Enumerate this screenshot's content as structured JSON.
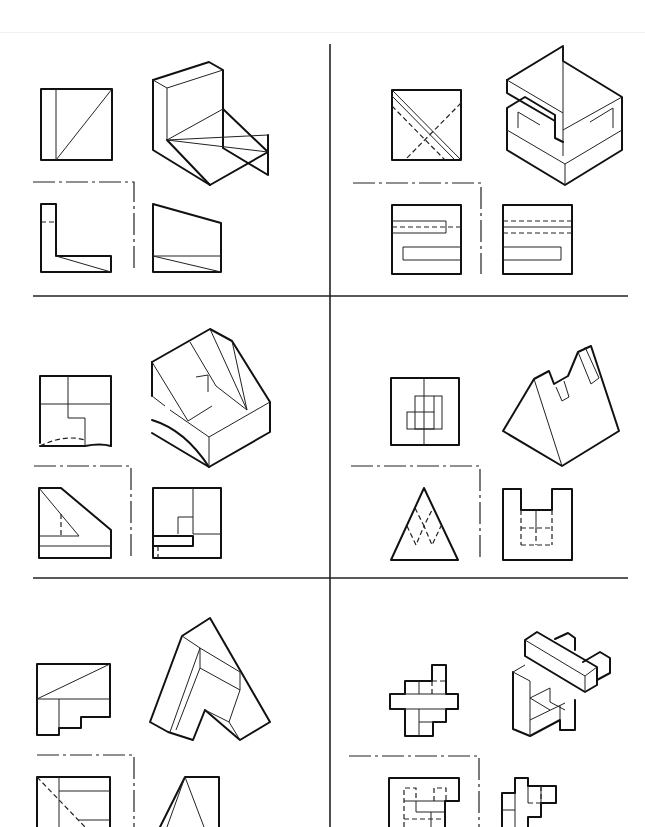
{
  "sheet": {
    "title": "Orthographic projection exercises",
    "panel_count": 6,
    "colors": {
      "ink": "#111111",
      "paper": "#ffffff"
    },
    "panels": [
      {
        "id": "A",
        "label": "L-bracket with triangular face",
        "views": [
          "top",
          "isometric",
          "front",
          "side"
        ]
      },
      {
        "id": "B",
        "label": "Cube with S-shaped slots",
        "views": [
          "top",
          "isometric",
          "front",
          "side"
        ]
      },
      {
        "id": "C",
        "label": "Curved-base stepped block",
        "views": [
          "top",
          "isometric",
          "front",
          "side"
        ]
      },
      {
        "id": "D",
        "label": "Triangular prism with notch",
        "views": [
          "top",
          "isometric",
          "front",
          "side"
        ]
      },
      {
        "id": "E",
        "label": "Wedge with V-cut",
        "views": [
          "top",
          "isometric",
          "front",
          "side"
        ]
      },
      {
        "id": "F",
        "label": "Interlocking bars",
        "views": [
          "top",
          "isometric",
          "front",
          "side"
        ]
      }
    ]
  }
}
